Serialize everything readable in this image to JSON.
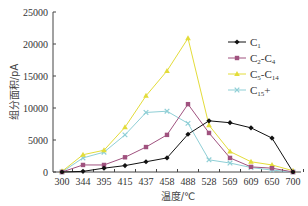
{
  "chart_data": {
    "type": "line",
    "title": "",
    "xlabel": "温度/℃",
    "ylabel": "组分面积/pA",
    "categories": [
      "300",
      "344",
      "395",
      "415",
      "437",
      "458",
      "488",
      "528",
      "569",
      "609",
      "650",
      "700"
    ],
    "ylim": [
      0,
      25000
    ],
    "yticks": [
      0,
      5000,
      10000,
      15000,
      20000,
      25000
    ],
    "grid": false,
    "legend_position": "upper right",
    "series": [
      {
        "name": "C1",
        "label_main": "C",
        "label_sub": "1",
        "color": "#111111",
        "marker": "diamond",
        "values": [
          0,
          100,
          600,
          1000,
          1600,
          2200,
          5900,
          8000,
          7700,
          6900,
          5300,
          0
        ]
      },
      {
        "name": "C2-C4",
        "label_main": "C",
        "label_sub": "2",
        "label_mid": "-C",
        "label_sub2": "4",
        "color": "#a0527f",
        "marker": "square",
        "values": [
          0,
          1100,
          1100,
          2300,
          3900,
          5800,
          10600,
          6100,
          2200,
          800,
          600,
          0
        ]
      },
      {
        "name": "C5-C14",
        "label_main": "C",
        "label_sub": "5",
        "label_mid": "-C",
        "label_sub2": "14",
        "color": "#e3dc3a",
        "marker": "triangle",
        "values": [
          100,
          2700,
          3400,
          7000,
          11900,
          15800,
          20900,
          7300,
          3200,
          1600,
          1100,
          200
        ]
      },
      {
        "name": "C15+",
        "label_main": "C",
        "label_sub": "15",
        "label_mid": "+",
        "color": "#8fcfd6",
        "marker": "x",
        "values": [
          0,
          2200,
          3100,
          5800,
          9300,
          9500,
          7600,
          1900,
          1400,
          700,
          300,
          0
        ]
      }
    ]
  }
}
